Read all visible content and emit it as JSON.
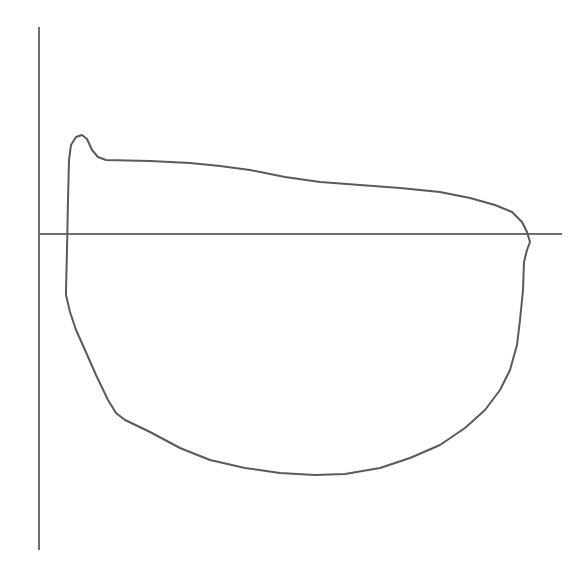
{
  "diagram": {
    "type": "closed-loop",
    "colors": {
      "background": "#ffffff",
      "axis": "#6e6e6e",
      "loop": "#5a5a5a"
    },
    "axes": {
      "vertical": {
        "x": 39,
        "y1": 27,
        "y2": 550,
        "label": ""
      },
      "horizontal": {
        "y": 234,
        "x1": 39,
        "x2": 562,
        "label": ""
      }
    },
    "loop_points": [
      [
        66,
        290
      ],
      [
        67,
        250
      ],
      [
        68,
        200
      ],
      [
        69,
        160
      ],
      [
        71,
        145
      ],
      [
        76,
        137
      ],
      [
        82,
        135
      ],
      [
        87,
        139
      ],
      [
        92,
        150
      ],
      [
        98,
        157
      ],
      [
        106,
        160
      ],
      [
        150,
        161
      ],
      [
        190,
        163
      ],
      [
        220,
        166
      ],
      [
        250,
        170
      ],
      [
        285,
        177
      ],
      [
        320,
        182
      ],
      [
        360,
        185
      ],
      [
        400,
        188
      ],
      [
        440,
        192
      ],
      [
        470,
        198
      ],
      [
        495,
        205
      ],
      [
        512,
        212
      ],
      [
        522,
        222
      ],
      [
        527,
        232
      ],
      [
        530,
        242
      ],
      [
        527,
        250
      ],
      [
        524,
        262
      ],
      [
        523,
        290
      ],
      [
        520,
        320
      ],
      [
        517,
        345
      ],
      [
        510,
        370
      ],
      [
        500,
        390
      ],
      [
        485,
        410
      ],
      [
        465,
        428
      ],
      [
        440,
        445
      ],
      [
        410,
        458
      ],
      [
        380,
        468
      ],
      [
        345,
        474
      ],
      [
        315,
        475
      ],
      [
        280,
        473
      ],
      [
        245,
        468
      ],
      [
        210,
        460
      ],
      [
        180,
        448
      ],
      [
        150,
        432
      ],
      [
        125,
        420
      ],
      [
        116,
        413
      ],
      [
        108,
        400
      ],
      [
        96,
        375
      ],
      [
        85,
        350
      ],
      [
        76,
        330
      ],
      [
        70,
        312
      ],
      [
        66,
        295
      ]
    ]
  }
}
